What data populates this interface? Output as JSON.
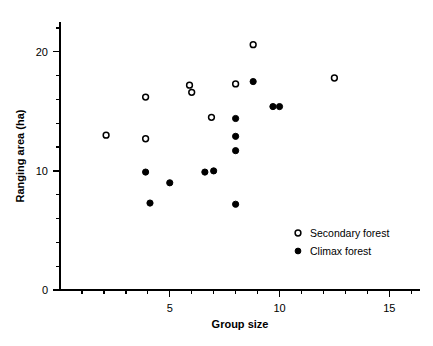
{
  "chart_data": {
    "type": "scatter",
    "title": "",
    "xlabel": "Group size",
    "ylabel": "Ranging area (ha)",
    "xlim": [
      0,
      16.4
    ],
    "ylim": [
      0,
      22.5
    ],
    "xticks": [
      5,
      10,
      15
    ],
    "xtick_labels": [
      "5",
      "10",
      "15"
    ],
    "xminor_step": 1,
    "yticks": [
      0,
      10,
      20
    ],
    "ytick_labels": [
      "0",
      "10",
      "20"
    ],
    "yminor_step": 2,
    "grid": false,
    "legend_position": "lower right",
    "series": [
      {
        "name": "Secondary forest",
        "marker": "open-circle",
        "color": "#000000",
        "points": [
          {
            "x": 2.1,
            "y": 13.0
          },
          {
            "x": 3.9,
            "y": 16.2
          },
          {
            "x": 3.9,
            "y": 12.7
          },
          {
            "x": 5.9,
            "y": 17.2
          },
          {
            "x": 6.0,
            "y": 16.6
          },
          {
            "x": 6.9,
            "y": 14.5
          },
          {
            "x": 8.0,
            "y": 17.3
          },
          {
            "x": 8.8,
            "y": 20.6
          },
          {
            "x": 12.5,
            "y": 17.8
          }
        ]
      },
      {
        "name": "Climax forest",
        "marker": "filled-circle",
        "color": "#000000",
        "points": [
          {
            "x": 3.9,
            "y": 9.9
          },
          {
            "x": 4.1,
            "y": 7.3
          },
          {
            "x": 5.0,
            "y": 9.0
          },
          {
            "x": 6.6,
            "y": 9.9
          },
          {
            "x": 7.0,
            "y": 10.0
          },
          {
            "x": 8.0,
            "y": 14.4
          },
          {
            "x": 8.0,
            "y": 12.9
          },
          {
            "x": 8.0,
            "y": 11.7
          },
          {
            "x": 8.0,
            "y": 7.2
          },
          {
            "x": 8.8,
            "y": 17.5
          },
          {
            "x": 9.7,
            "y": 15.4
          },
          {
            "x": 10.0,
            "y": 15.4
          }
        ]
      }
    ]
  },
  "legend": {
    "entries": [
      {
        "label": "Secondary forest",
        "marker": "open-circle"
      },
      {
        "label": "Climax forest",
        "marker": "filled-circle"
      }
    ]
  }
}
